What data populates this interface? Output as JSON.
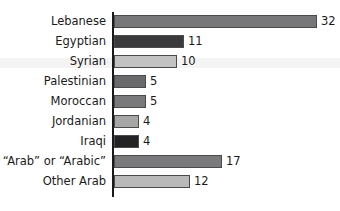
{
  "chart_data": {
    "type": "bar",
    "orientation": "horizontal",
    "title": "",
    "subtitle": "",
    "xlabel": "",
    "ylabel": "",
    "categories": [
      "Lebanese",
      "Egyptian",
      "Syrian",
      "Palestinian",
      "Moroccan",
      "Jordanian",
      "Iraqi",
      "“Arab” or “Arabic”",
      "Other Arab"
    ],
    "values": [
      32,
      11,
      10,
      5,
      5,
      4,
      4,
      17,
      12
    ],
    "value_labels": [
      "32",
      "11",
      "10",
      "5",
      "5",
      "4",
      "4",
      "17",
      "12"
    ],
    "bar_colors": [
      "#77777a",
      "#3a3a3c",
      "#c2c2c2",
      "#6a6a6c",
      "#79797b",
      "#a6a6a6",
      "#232325",
      "#7a7a7c",
      "#b9b9b9"
    ],
    "axis_color": "#1a1a1a",
    "bar_border_color": "#4a4a4a",
    "text_color": "#1a1a1a",
    "grid": false,
    "legend": null,
    "xlim": [
      0,
      32
    ],
    "axis_visible": "y-axis-only",
    "tick_labels": [],
    "annotations": []
  },
  "layout": {
    "px_per_unit": 6.34,
    "bar_height_px": 13,
    "row_pitch_px": 20,
    "first_row_top_px": 15,
    "axis_x_px": 113
  }
}
